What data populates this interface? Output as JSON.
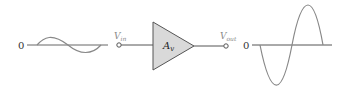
{
  "diagram": {
    "input": {
      "zero_label": "0",
      "terminal_label": "V",
      "terminal_subscript": "in",
      "waveform": "sine",
      "amplitude_px": 8
    },
    "amplifier": {
      "gain_label": "A",
      "gain_subscript": "v",
      "fill": "#d9d9d9",
      "stroke": "#555555"
    },
    "output": {
      "zero_label": "0",
      "terminal_label": "V",
      "terminal_subscript": "out",
      "waveform": "inverted sine",
      "amplitude_px": 40
    },
    "colors": {
      "wave": "#777777",
      "axis": "#555555",
      "label": "#8a8a8a"
    }
  }
}
